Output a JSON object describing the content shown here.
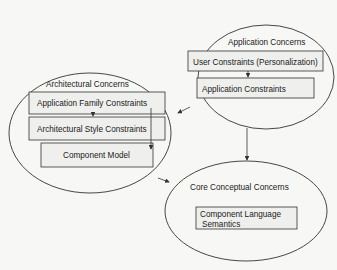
{
  "diagram": {
    "nodes": {
      "application": {
        "title": "Application Concerns",
        "boxes": [
          "User Constraints (Personalization)",
          "Application Constraints"
        ]
      },
      "architectural": {
        "title": "Architectural Concerns",
        "boxes": [
          "Application Family Constraints",
          "Architectural Style Constraints",
          "Component Model"
        ]
      },
      "core": {
        "title": "Core Conceptual Concerns",
        "box_lines": [
          "Component Language",
          "Semantics"
        ]
      }
    },
    "edges": [
      {
        "from": "User Constraints (Personalization)",
        "to": "Application Constraints"
      },
      {
        "from": "Application Family Constraints",
        "to": "Architectural Style Constraints"
      },
      {
        "from": "Application Family Constraints",
        "to": "Component Model"
      },
      {
        "from": "Application Concerns",
        "to": "Architectural Concerns"
      },
      {
        "from": "Application Concerns",
        "to": "Core Conceptual Concerns"
      },
      {
        "from": "Architectural Concerns",
        "to": "Core Conceptual Concerns"
      }
    ],
    "colors": {
      "stroke": "#333333",
      "box_fill": "#eeeeec",
      "background": "#f7f7f5"
    }
  }
}
